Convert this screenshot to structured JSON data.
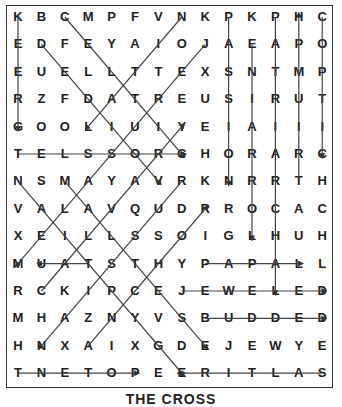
{
  "puzzle": {
    "title": "THE CROSS",
    "rows": [
      "KBCMPFVNKPKPHC",
      "EDFEYAIOJAEAPO",
      "EULLTTEXSNTMP",
      "RZFDATREUSIRUT",
      "GOOLIUIYEIAIII",
      "TELSSORCHORARC",
      "NSMAYAVRKNRRTH",
      "VALAVQUDRROCAC",
      "XEILLSSOIGLHUH",
      "MUATSTHYPAPALL",
      "RCKIPCEJEWELED",
      "MHAZNYVSBUDDED",
      "HNXAIXGDEJEWYE",
      "TNETOPEERITLAS"
    ],
    "grid": [
      [
        "K",
        "B",
        "C",
        "M",
        "P",
        "F",
        "V",
        "N",
        "K",
        "P",
        "K",
        "P",
        "H",
        "C"
      ],
      [
        "E",
        "D",
        "F",
        "E",
        "Y",
        "A",
        "I",
        "O",
        "J",
        "A",
        "E",
        "A",
        "P",
        "O"
      ],
      [
        "E",
        "U",
        "E",
        "L",
        "L",
        "T",
        "T",
        "E",
        "X",
        "S",
        "N",
        "T",
        "M",
        "P"
      ],
      [
        "R",
        "Z",
        "F",
        "D",
        "A",
        "T",
        "R",
        "E",
        "U",
        "S",
        "I",
        "R",
        "U",
        "T"
      ],
      [
        "G",
        "O",
        "O",
        "L",
        "I",
        "U",
        "I",
        "Y",
        "E",
        "I",
        "A",
        "I",
        "I",
        "I"
      ],
      [
        "T",
        "E",
        "L",
        "S",
        "S",
        "O",
        "R",
        "C",
        "H",
        "O",
        "R",
        "A",
        "R",
        "C"
      ],
      [
        "N",
        "S",
        "M",
        "A",
        "Y",
        "A",
        "V",
        "R",
        "K",
        "N",
        "R",
        "R",
        "T",
        "H"
      ],
      [
        "V",
        "A",
        "L",
        "A",
        "V",
        "Q",
        "U",
        "D",
        "R",
        "R",
        "O",
        "C",
        "A",
        "C"
      ],
      [
        "X",
        "E",
        "I",
        "L",
        "L",
        "S",
        "S",
        "O",
        "I",
        "G",
        "L",
        "H",
        "U",
        "H"
      ],
      [
        "M",
        "U",
        "A",
        "T",
        "S",
        "T",
        "H",
        "Y",
        "P",
        "A",
        "P",
        "A",
        "L",
        "L"
      ],
      [
        "R",
        "C",
        "K",
        "I",
        "P",
        "C",
        "E",
        "J",
        "E",
        "W",
        "E",
        "L",
        "E",
        "D"
      ],
      [
        "M",
        "H",
        "A",
        "Z",
        "N",
        "Y",
        "V",
        "S",
        "B",
        "U",
        "D",
        "D",
        "E",
        "D"
      ],
      [
        "H",
        "N",
        "X",
        "A",
        "I",
        "X",
        "G",
        "D",
        "E",
        "J",
        "E",
        "W",
        "Y",
        "E"
      ],
      [
        "T",
        "N",
        "E",
        "T",
        "O",
        "P",
        "E",
        "E",
        "R",
        "I",
        "T",
        "L",
        "A",
        "S"
      ]
    ],
    "found_lines": [
      {
        "word": "GREEK",
        "from": [
          0,
          0
        ],
        "to": [
          4,
          0
        ]
      },
      {
        "word": "CROSSLET",
        "from": [
          5,
          0
        ],
        "to": [
          5,
          7
        ]
      },
      {
        "word": "CELTIC",
        "from": [
          0,
          2
        ],
        "to": [
          5,
          7
        ]
      },
      {
        "word": "VOIDED",
        "from": [
          1,
          1
        ],
        "to": [
          6,
          6
        ]
      },
      {
        "word": "LATIN",
        "from": [
          0,
          7
        ],
        "to": [
          4,
          3
        ]
      },
      {
        "word": "JERUSALEM",
        "from": [
          1,
          8
        ],
        "to": [
          9,
          0
        ]
      },
      {
        "word": "CALVARY",
        "from": [
          10,
          1
        ],
        "to": [
          4,
          7
        ]
      },
      {
        "word": "",
        "from": [
          6,
          0
        ],
        "to": [
          13,
          7
        ]
      },
      {
        "word": "MALTESE",
        "from": [
          6,
          2
        ],
        "to": [
          12,
          8
        ]
      },
      {
        "word": "RUSSIAN",
        "from": [
          6,
          7
        ],
        "to": [
          12,
          1
        ]
      },
      {
        "word": "ANCHOR",
        "from": [
          12,
          3
        ],
        "to": [
          7,
          8
        ]
      },
      {
        "word": "PASSION",
        "from": [
          0,
          9
        ],
        "to": [
          6,
          9
        ]
      },
      {
        "word": "LORRAINE",
        "from": [
          1,
          10
        ],
        "to": [
          8,
          10
        ]
      },
      {
        "word": "PATRIARCHAL",
        "from": [
          0,
          11
        ],
        "to": [
          10,
          11
        ]
      },
      {
        "word": "TRIUMPH",
        "from": [
          6,
          12
        ],
        "to": [
          0,
          12
        ]
      },
      {
        "word": "COPTIC",
        "from": [
          0,
          13
        ],
        "to": [
          5,
          13
        ]
      },
      {
        "word": "PAPAL",
        "from": [
          9,
          8
        ],
        "to": [
          9,
          12
        ]
      },
      {
        "word": "JEWELLED",
        "from": [
          10,
          7
        ],
        "to": [
          10,
          13
        ]
      },
      {
        "word": "BUDDED",
        "from": [
          11,
          8
        ],
        "to": [
          11,
          13
        ]
      },
      {
        "word": "POTENT",
        "from": [
          13,
          0
        ],
        "to": [
          13,
          5
        ]
      },
      {
        "word": "SALTIRE",
        "from": [
          13,
          13
        ],
        "to": [
          13,
          7
        ]
      },
      {
        "word": "TAU",
        "from": [
          9,
          3
        ],
        "to": [
          9,
          1
        ]
      }
    ],
    "colors": {
      "line": "#444444",
      "text": "#222222",
      "border": "#333333"
    }
  }
}
